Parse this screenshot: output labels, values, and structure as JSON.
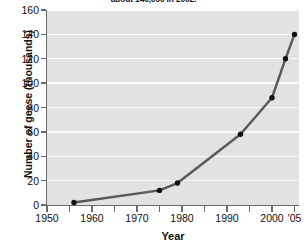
{
  "chart_data": {
    "type": "line",
    "title": "about 140,000 in 2002.",
    "xlabel": "Year",
    "ylabel": "Number of geese (thousands)",
    "xlim": [
      1950,
      2006
    ],
    "ylim": [
      0,
      160
    ],
    "yticks": [
      0,
      20,
      40,
      60,
      80,
      100,
      120,
      140,
      160
    ],
    "ytick_labels": [
      "0",
      "20",
      "40",
      "60",
      "80",
      "100",
      "120",
      "140",
      "160"
    ],
    "xticks": [
      1950,
      1960,
      1970,
      1980,
      1990,
      2000,
      2005
    ],
    "xtick_labels": [
      "1950",
      "1960",
      "1970",
      "1980",
      "1990",
      "2000",
      "'05"
    ],
    "x_minor_ticks": [
      1955,
      1965,
      1975,
      1985,
      1995
    ],
    "grid": "horizontal",
    "legend": "none",
    "series": [
      {
        "name": "Number of geese",
        "x": [
          1956,
          1975,
          1979,
          1993,
          2000,
          2003,
          2005
        ],
        "values": [
          2,
          12,
          18,
          58,
          88,
          120,
          140
        ]
      }
    ],
    "colors": {
      "line": "#595959",
      "marker": "#111111",
      "plot_background": "#e2e2e2",
      "gridline": "#fbfbfb",
      "axis": "#6b6b6b",
      "text": "#111111"
    }
  }
}
